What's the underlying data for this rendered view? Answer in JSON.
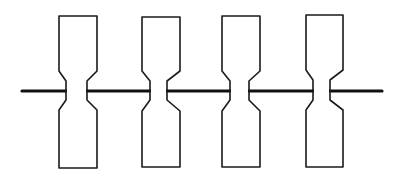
{
  "diagram": {
    "colors": {
      "background": "#ffffff",
      "stroke": "#1a1a1a",
      "rod": "#111111"
    },
    "rod": {
      "x1": 22,
      "x2": 382,
      "y": 91
    },
    "specimens": [
      {
        "id": 1,
        "left": 59,
        "right": 97,
        "top": 16,
        "bottom": 168,
        "neck_left": 66,
        "neck_right": 87,
        "shoulder_top": 71,
        "neck_top": 81,
        "neck_bottom": 100,
        "shoulder_bottom": 110
      },
      {
        "id": 2,
        "left": 142,
        "right": 180,
        "top": 17,
        "bottom": 167,
        "neck_left": 150,
        "neck_right": 167,
        "shoulder_top": 71,
        "neck_top": 81,
        "neck_bottom": 100,
        "shoulder_bottom": 111
      },
      {
        "id": 3,
        "left": 222,
        "right": 260,
        "top": 16,
        "bottom": 167,
        "neck_left": 230,
        "neck_right": 249,
        "shoulder_top": 71,
        "neck_top": 81,
        "neck_bottom": 100,
        "shoulder_bottom": 111
      },
      {
        "id": 4,
        "left": 306,
        "right": 343,
        "top": 15,
        "bottom": 167,
        "neck_left": 313,
        "neck_right": 330,
        "shoulder_top": 70,
        "neck_top": 80,
        "neck_bottom": 100,
        "shoulder_bottom": 110
      }
    ]
  }
}
